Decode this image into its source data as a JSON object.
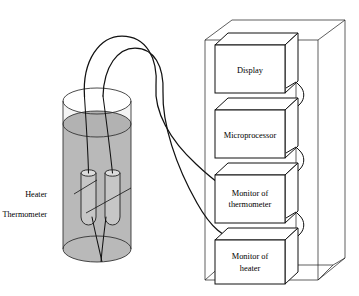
{
  "figure": {
    "background_color": "#ffffff",
    "line_color": "#111111"
  },
  "vessel": {
    "name": "transparent cylindrical vessel",
    "liquid_fill_color": "#b9b9b9",
    "probe_fill_color": "#c3c3c3",
    "glass_tint_color": "#d6d6d6"
  },
  "callouts": [
    {
      "id": "heater",
      "label": "Heater"
    },
    {
      "id": "thermometer",
      "label": "Thermometer"
    }
  ],
  "cabinet": {
    "name": "electronics cabinet",
    "frame_color": "#333333",
    "modules": [
      {
        "id": "display",
        "line1": "Display",
        "line2": ""
      },
      {
        "id": "microprocessor",
        "line1": "Microprocessor",
        "line2": ""
      },
      {
        "id": "monitor-thermometer",
        "line1": "Monitor of",
        "line2": "thermometer"
      },
      {
        "id": "monitor-heater",
        "line1": "Monitor of",
        "line2": "heater"
      }
    ]
  },
  "cables": [
    {
      "id": "thermometer-cable",
      "from": "thermometer probe",
      "to": "monitor-thermometer"
    },
    {
      "id": "heater-cable",
      "from": "heater probe",
      "to": "monitor-heater"
    }
  ]
}
